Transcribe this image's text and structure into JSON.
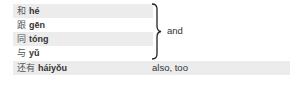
{
  "group": {
    "items": [
      {
        "hanzi": "和",
        "pinyin": "hé",
        "shaded": true
      },
      {
        "hanzi": "跟",
        "pinyin": "gēn",
        "shaded": false
      },
      {
        "hanzi": "同",
        "pinyin": "tóng",
        "shaded": true
      },
      {
        "hanzi": "与",
        "pinyin": "yǔ",
        "shaded": false
      }
    ],
    "meaning": "and"
  },
  "single": {
    "hanzi": "还有",
    "pinyin": "háiyǒu",
    "meaning": "also, too"
  },
  "colors": {
    "shade": "#ececec",
    "text": "#333333"
  }
}
